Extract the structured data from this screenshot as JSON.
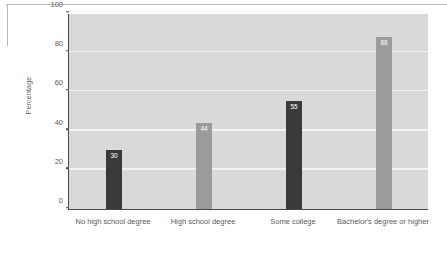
{
  "chart_data": {
    "type": "bar",
    "title": "",
    "xlabel": "",
    "ylabel": "Percentage",
    "categories": [
      "No high school degree",
      "High school degree",
      "Some college",
      "Bachelor's degree or higher"
    ],
    "values": [
      30,
      44,
      55,
      88
    ],
    "value_labels": [
      "30",
      "44",
      "55",
      "88"
    ],
    "bar_colors": [
      "#3a3a3a",
      "#9b9b9b",
      "#3a3a3a",
      "#9b9b9b"
    ],
    "ylim": [
      0,
      100
    ],
    "yticks": [
      0,
      20,
      40,
      60,
      80,
      100
    ],
    "ytick_labels": [
      "0",
      "20",
      "40",
      "60",
      "80",
      "100"
    ],
    "grid": true,
    "grid_color": "#f2f2f2",
    "plot_background": "#d9d9d9",
    "axis_color": "#4a4a4a",
    "legend": null,
    "legend_position": "none"
  }
}
